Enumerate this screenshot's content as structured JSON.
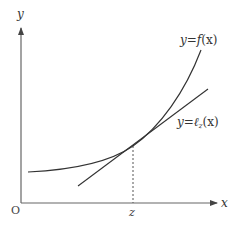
{
  "diagram": {
    "axes": {
      "x_label": "x",
      "y_label": "y",
      "origin_label": "O"
    },
    "curve": {
      "label": "y=f(x)",
      "label_parts": {
        "prefix": "y=",
        "func": "f",
        "arg": "(x)"
      }
    },
    "tangent": {
      "label": "y=ℓz(x)",
      "label_parts": {
        "prefix": "y=",
        "func": "ℓ",
        "sub": "z",
        "arg": "(x)"
      }
    },
    "tangent_point": {
      "label": "z"
    },
    "colors": {
      "axis": "#555555",
      "curve": "#333333",
      "tangent": "#333333",
      "dashed": "#555555",
      "text": "#333333"
    }
  }
}
